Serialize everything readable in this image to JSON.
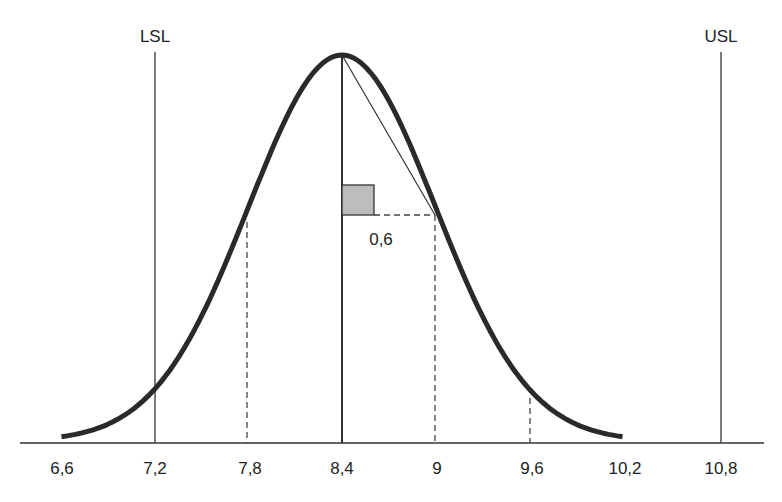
{
  "chart_data": {
    "type": "line",
    "title": "",
    "xlabel": "",
    "ylabel": "",
    "x_ticks": [
      "6,6",
      "7,2",
      "7,8",
      "8,4",
      "9",
      "9,6",
      "10,2",
      "10,8"
    ],
    "x_tick_values": [
      6.6,
      7.2,
      7.8,
      8.4,
      9.0,
      9.6,
      10.2,
      10.8
    ],
    "xlim": [
      6.6,
      10.8
    ],
    "grid": false,
    "series": [
      {
        "name": "normal-curve",
        "mean": 8.4,
        "sigma": 0.6,
        "x_range": [
          6.6,
          10.2
        ]
      }
    ],
    "spec_limits": [
      {
        "label": "LSL",
        "value": 7.2
      },
      {
        "label": "USL",
        "value": 10.8
      }
    ],
    "mean_line": {
      "value": 8.4
    },
    "sigma_markers": [
      7.8,
      9.0,
      9.6
    ],
    "annotations": [
      {
        "text": "0,6",
        "meaning": "sigma distance from mean to inflection point"
      }
    ]
  },
  "labels": {
    "lsl": "LSL",
    "usl": "USL",
    "sigma": "0,6",
    "ticks": [
      "6,6",
      "7,2",
      "7,8",
      "8,4",
      "9",
      "9,6",
      "10,2",
      "10,8"
    ]
  }
}
